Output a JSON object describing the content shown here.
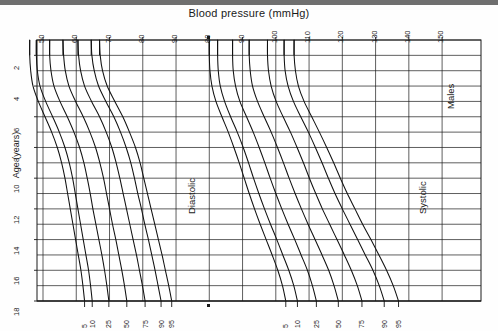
{
  "topbar": {
    "present": true
  },
  "chart_data": {
    "type": "line",
    "title": "Blood pressure (mmHg)",
    "xlabel": "Blood pressure (mmHg)",
    "ylabel": "Age (years)",
    "grid": true,
    "legend_position": "inline-annotations",
    "group_label": "Males",
    "annotations": [
      {
        "name": "diastolic-label",
        "text": "Diastolic"
      },
      {
        "name": "systolic-label",
        "text": "Systolic"
      }
    ],
    "xlim": [
      45,
      155
    ],
    "ylim": [
      1,
      18
    ],
    "x_ticks": [
      50,
      60,
      70,
      80,
      90,
      80,
      90,
      100,
      110,
      120,
      130,
      140,
      150
    ],
    "x_tick_labels": [
      "50",
      "60",
      "70",
      "80",
      "90",
      "80",
      "90",
      "100",
      "110",
      "120",
      "130",
      "140",
      "150"
    ],
    "x_tick_positions": [
      50,
      60,
      70,
      80,
      90,
      100,
      110,
      120,
      130,
      140,
      150,
      160,
      170
    ],
    "y_ticks": [
      2,
      4,
      6,
      8,
      10,
      12,
      14,
      16,
      18
    ],
    "y_tick_labels": [
      "2",
      "4",
      "6",
      "8",
      "10",
      "12",
      "14",
      "16",
      "18"
    ],
    "y_gridlines": [
      1,
      2,
      3,
      4,
      5,
      6,
      7,
      8,
      9,
      10,
      11,
      12,
      13,
      14,
      15,
      16,
      17,
      18
    ],
    "percentile_labels": [
      "5",
      "10",
      "25",
      "50",
      "75",
      "90",
      "95"
    ],
    "diastolic": {
      "name": "Diastolic",
      "ages": [
        1,
        2,
        3,
        4,
        5,
        6,
        7,
        8,
        9,
        10,
        11,
        12,
        13,
        14,
        15,
        16,
        17,
        18
      ],
      "series": [
        {
          "name": "5",
          "percentile": 5,
          "values": [
            46,
            46,
            46.3,
            47,
            48.6,
            50.6,
            52.6,
            54.3,
            55.6,
            56.6,
            57.4,
            58.2,
            59,
            59.8,
            60.6,
            61.4,
            62,
            62.5
          ]
        },
        {
          "name": "10",
          "percentile": 10,
          "values": [
            48,
            48,
            48.3,
            49.1,
            50.8,
            52.9,
            54.9,
            56.6,
            57.9,
            58.9,
            59.7,
            60.5,
            61.3,
            62.1,
            62.9,
            63.7,
            64.3,
            64.8
          ]
        },
        {
          "name": "25",
          "percentile": 25,
          "values": [
            52,
            52,
            52.4,
            53.3,
            55.1,
            57.3,
            59.3,
            61,
            62.3,
            63.3,
            64.2,
            65,
            65.9,
            66.8,
            67.7,
            68.5,
            69.2,
            69.8
          ]
        },
        {
          "name": "50",
          "percentile": 50,
          "values": [
            56,
            56.2,
            56.7,
            57.8,
            59.8,
            62.1,
            64.1,
            65.8,
            67.1,
            68.2,
            69.1,
            70,
            70.9,
            71.9,
            72.8,
            73.7,
            74.5,
            75.2
          ]
        },
        {
          "name": "75",
          "percentile": 75,
          "values": [
            60.5,
            60.7,
            61.3,
            62.5,
            64.6,
            67,
            69,
            70.7,
            72,
            73.1,
            74.1,
            75.1,
            76.1,
            77.1,
            78.1,
            79,
            79.9,
            80.7
          ]
        },
        {
          "name": "90",
          "percentile": 90,
          "values": [
            64.5,
            64.7,
            65.4,
            66.7,
            68.9,
            71.3,
            73.3,
            75,
            76.4,
            77.5,
            78.5,
            79.6,
            80.6,
            81.7,
            82.7,
            83.7,
            84.6,
            85.5
          ]
        },
        {
          "name": "95",
          "percentile": 95,
          "values": [
            67,
            67.2,
            67.9,
            69.3,
            71.6,
            74,
            76,
            77.8,
            79.2,
            80.3,
            81.4,
            82.5,
            83.6,
            84.7,
            85.8,
            86.8,
            87.8,
            88.7
          ]
        }
      ]
    },
    "systolic": {
      "name": "Systolic",
      "ages": [
        1,
        2,
        3,
        4,
        5,
        6,
        7,
        8,
        9,
        10,
        11,
        12,
        13,
        14,
        15,
        16,
        17,
        18
      ],
      "values_note": "Systolic curves plotted on the right-hand scale (80-150 mmHg)",
      "series": [
        {
          "name": "5",
          "percentile": 5,
          "values": [
            80,
            80,
            80.2,
            80.8,
            82,
            83.8,
            85.7,
            87.4,
            89,
            90.5,
            92,
            93.6,
            95.3,
            97.1,
            98.9,
            100.6,
            102,
            103
          ]
        },
        {
          "name": "10",
          "percentile": 10,
          "values": [
            82.5,
            82.5,
            82.7,
            83.3,
            84.6,
            86.4,
            88.4,
            90.2,
            91.8,
            93.3,
            94.9,
            96.6,
            98.4,
            100.3,
            102.1,
            103.9,
            105.4,
            106.5
          ]
        },
        {
          "name": "25",
          "percentile": 25,
          "values": [
            87,
            87,
            87.2,
            87.9,
            89.2,
            91.2,
            93.2,
            95,
            96.7,
            98.3,
            100,
            101.8,
            103.7,
            105.7,
            107.6,
            109.5,
            111,
            112.2
          ]
        },
        {
          "name": "50",
          "percentile": 50,
          "values": [
            92,
            92,
            92.3,
            93,
            94.5,
            96.5,
            98.6,
            100.5,
            102.3,
            104,
            105.8,
            107.7,
            109.7,
            111.8,
            113.9,
            115.9,
            117.5,
            118.8
          ]
        },
        {
          "name": "75",
          "percentile": 75,
          "values": [
            97.5,
            97.5,
            97.8,
            98.6,
            100.1,
            102.2,
            104.4,
            106.4,
            108.3,
            110.1,
            112,
            114,
            116.2,
            118.4,
            120.6,
            122.7,
            124.5,
            125.9
          ]
        },
        {
          "name": "90",
          "percentile": 90,
          "values": [
            102.5,
            102.5,
            102.8,
            103.7,
            105.3,
            107.5,
            109.8,
            111.9,
            113.9,
            115.8,
            117.8,
            120,
            122.3,
            124.6,
            126.9,
            129.2,
            131.1,
            132.6
          ]
        },
        {
          "name": "95",
          "percentile": 95,
          "values": [
            105.5,
            105.5,
            105.9,
            106.8,
            108.5,
            110.8,
            113.1,
            115.3,
            117.4,
            119.4,
            121.5,
            123.8,
            126.1,
            128.6,
            131,
            133.3,
            135.3,
            136.9
          ]
        }
      ]
    }
  }
}
